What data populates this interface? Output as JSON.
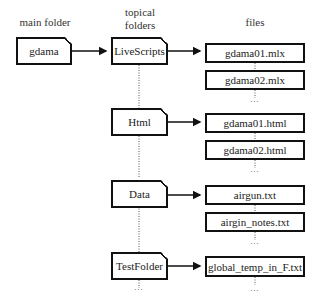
{
  "headers": {
    "main_folder": "main folder",
    "topical_folders_line1": "topical",
    "topical_folders_line2": "folders",
    "files": "files"
  },
  "main_folder": {
    "name": "gdama"
  },
  "topical_folders": [
    {
      "name": "LiveScripts",
      "files": [
        "gdama01.mlx",
        "gdama02.mlx"
      ]
    },
    {
      "name": "Html",
      "files": [
        "gdama01.html",
        "gdama02.html"
      ]
    },
    {
      "name": "Data",
      "files": [
        "airgun.txt",
        "airgin_notes.txt"
      ]
    },
    {
      "name": "TestFolder",
      "files": [
        "global_temp_in_F.txt"
      ]
    }
  ],
  "ellipsis": "…"
}
